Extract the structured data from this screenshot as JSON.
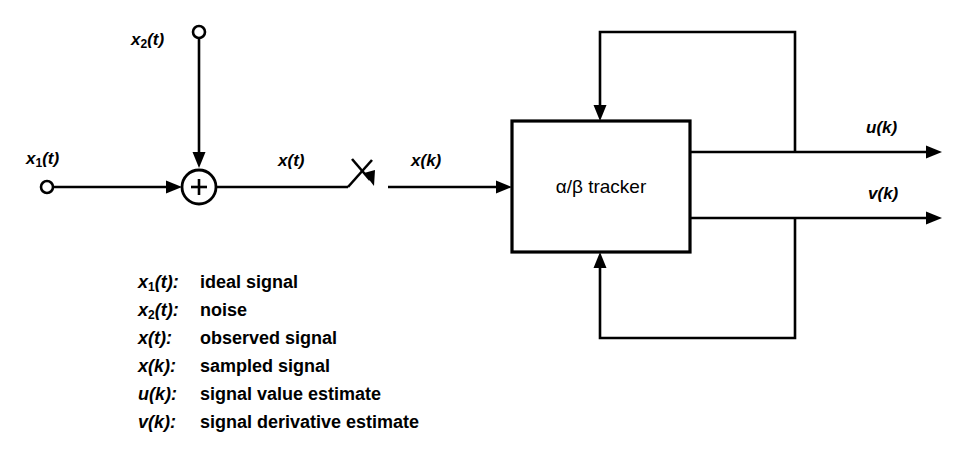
{
  "diagram": {
    "background_color": "#ffffff",
    "line_color": "#000000",
    "block": {
      "label_alpha": "α",
      "label_slash": "/",
      "label_beta": "β",
      "label_name": "tracker",
      "label_full": "α/β tracker"
    },
    "summing_junction": {
      "operator": "+"
    },
    "signals": {
      "x1_base": "x",
      "x1_sub": "1",
      "x1_arg": "(t)",
      "x2_base": "x",
      "x2_sub": "2",
      "x2_arg": "(t)",
      "xt_base": "x",
      "xt_arg": "(t)",
      "xk_base": "x",
      "xk_arg": "(k)",
      "uk_base": "u",
      "uk_arg": "(k)",
      "vk_base": "v",
      "vk_arg": "(k)"
    }
  },
  "legend": {
    "rows": [
      {
        "symbol_base": "x",
        "symbol_sub": "1",
        "symbol_arg": "(t):",
        "description": "ideal signal"
      },
      {
        "symbol_base": "x",
        "symbol_sub": "2",
        "symbol_arg": "(t):",
        "description": "noise"
      },
      {
        "symbol_base": "x",
        "symbol_sub": "",
        "symbol_arg": "(t):",
        "description": "observed signal"
      },
      {
        "symbol_base": "x",
        "symbol_sub": "",
        "symbol_arg": "(k):",
        "description": "sampled signal"
      },
      {
        "symbol_base": "u",
        "symbol_sub": "",
        "symbol_arg": "(k):",
        "description": "signal value estimate"
      },
      {
        "symbol_base": "v",
        "symbol_sub": "",
        "symbol_arg": "(k):",
        "description": "signal derivative estimate"
      }
    ]
  }
}
